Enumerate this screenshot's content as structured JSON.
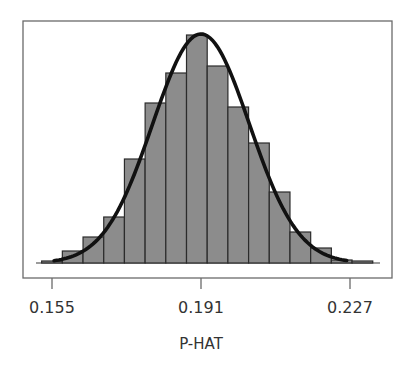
{
  "chart_data": {
    "type": "bar",
    "subtype": "histogram_with_normal_curve",
    "title": "",
    "xlabel": "P-HAT",
    "ylabel": "",
    "x_ticks": [
      0.155,
      0.191,
      0.227
    ],
    "x_tick_labels": [
      "0.155",
      "0.191",
      "0.227"
    ],
    "xlim": [
      0.1495,
      0.2392
    ],
    "y_axis_shown": false,
    "grid": false,
    "legend": null,
    "bin_width": 0.005,
    "bin_edges": [
      0.1525,
      0.1575,
      0.1625,
      0.1675,
      0.1725,
      0.1775,
      0.1825,
      0.1875,
      0.1925,
      0.1975,
      0.2025,
      0.2075,
      0.2125,
      0.2175,
      0.2225,
      0.2275,
      0.2325
    ],
    "categories": [
      "0.155",
      "0.160",
      "0.165",
      "0.170",
      "0.175",
      "0.180",
      "0.185",
      "0.190",
      "0.195",
      "0.200",
      "0.205",
      "0.210",
      "0.215",
      "0.220",
      "0.225",
      "0.230"
    ],
    "values": [
      2,
      12,
      26,
      46,
      104,
      160,
      190,
      228,
      197,
      156,
      120,
      71,
      31,
      15,
      3,
      2
    ],
    "values_note": "relative bar heights (no y-axis scale shown)",
    "overlay_curve": {
      "type": "normal",
      "mean": 0.191,
      "peak_height": 229,
      "sd": 0.0117,
      "x_start": 0.1555,
      "x_end": 0.2262
    },
    "colors": {
      "bar_fill": "#8c8c8c",
      "bar_edge": "#2b2b2b",
      "curve": "#111111",
      "frame": "#6a6a6a",
      "text": "#333333"
    }
  }
}
